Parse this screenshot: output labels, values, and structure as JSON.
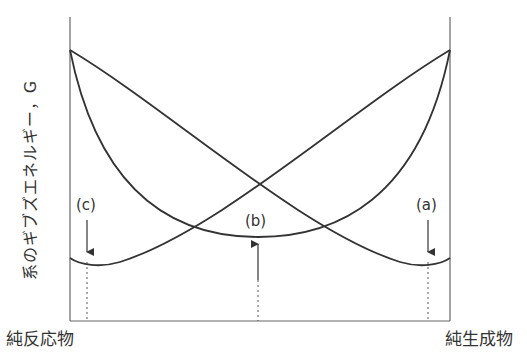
{
  "diagram": {
    "y_axis_label": "系のギブズエネルギー，G",
    "x_left_label": "純反応物",
    "x_right_label": "純生成物",
    "points": [
      {
        "id": "c",
        "label": "(c)"
      },
      {
        "id": "b",
        "label": "(b)"
      },
      {
        "id": "a",
        "label": "(a)"
      }
    ],
    "colors": {
      "line": "#333333",
      "dotted": "#555555",
      "background": "#ffffff"
    }
  }
}
